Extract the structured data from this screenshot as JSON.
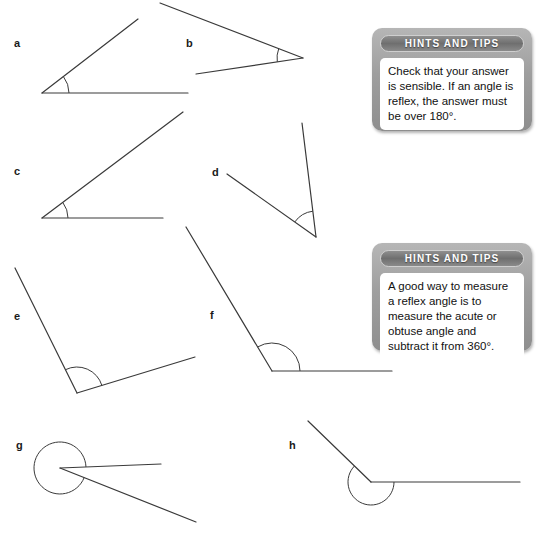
{
  "page": {
    "background_color": "#ffffff",
    "line_color": "#3a3a3a",
    "label_color": "#1a1a1a"
  },
  "figures": [
    {
      "id": "a",
      "label": "a",
      "label_pos": [
        14,
        38
      ],
      "angle_type": "acute",
      "vertex": [
        42,
        93
      ],
      "rays": [
        [
          188,
          93
        ],
        [
          138,
          19
        ]
      ],
      "arc_radius": 27,
      "arc_marks": 1
    },
    {
      "id": "b",
      "label": "b",
      "label_pos": [
        186,
        38
      ],
      "angle_type": "acute",
      "vertex": [
        303,
        58
      ],
      "rays": [
        [
          196,
          74
        ],
        [
          160,
          3
        ]
      ],
      "arc_radius": 26,
      "arc_marks": 1
    },
    {
      "id": "c",
      "label": "c",
      "label_pos": [
        14,
        166
      ],
      "angle_type": "acute",
      "vertex": [
        42,
        218
      ],
      "rays": [
        [
          163,
          218
        ],
        [
          183,
          112
        ]
      ],
      "arc_radius": 26,
      "arc_marks": 1
    },
    {
      "id": "d",
      "label": "d",
      "label_pos": [
        212,
        167
      ],
      "angle_type": "acute",
      "vertex": [
        316,
        237
      ],
      "rays": [
        [
          227,
          174
        ],
        [
          302,
          123
        ]
      ],
      "arc_radius": 26,
      "arc_marks": 1
    },
    {
      "id": "e",
      "label": "e",
      "label_pos": [
        14,
        311
      ],
      "angle_type": "obtuse",
      "vertex": [
        77,
        393
      ],
      "rays": [
        [
          195,
          357
        ],
        [
          15,
          268
        ]
      ],
      "arc_radius": 26,
      "arc_marks": 1
    },
    {
      "id": "f",
      "label": "f",
      "label_pos": [
        210,
        310
      ],
      "angle_type": "obtuse",
      "vertex": [
        272,
        371
      ],
      "rays": [
        [
          392,
          371
        ],
        [
          186,
          227
        ]
      ],
      "arc_radius": 28,
      "arc_marks": 1
    },
    {
      "id": "g",
      "label": "g",
      "label_pos": [
        16,
        440
      ],
      "angle_type": "reflex",
      "vertex": [
        60,
        468
      ],
      "rays": [
        [
          161,
          464
        ],
        [
          196,
          522
        ]
      ],
      "arc_radius": 26,
      "arc_marks": 1
    },
    {
      "id": "h",
      "label": "h",
      "label_pos": [
        289,
        440
      ],
      "angle_type": "reflex",
      "vertex": [
        371,
        482
      ],
      "rays": [
        [
          520,
          482
        ],
        [
          308,
          421
        ]
      ],
      "arc_radius": 23,
      "arc_marks": 1
    }
  ],
  "hint_boxes": [
    {
      "id": "hint-1",
      "title": "HINTS AND TIPS",
      "text": "Check that your answer is sensible. If an angle is reflex, the answer must be over 180°.",
      "rect": [
        372,
        28,
        160,
        103
      ]
    },
    {
      "id": "hint-2",
      "title": "HINTS AND TIPS",
      "text": "A good way to measure a reflex angle is to measure the acute or obtuse angle and subtract it from 360°.",
      "rect": [
        372,
        243,
        160,
        108
      ]
    }
  ]
}
